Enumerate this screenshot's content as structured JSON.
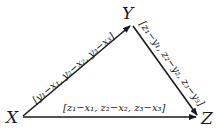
{
  "diagram": {
    "vertices": {
      "X": {
        "label": "X"
      },
      "Y": {
        "label": "Y"
      },
      "Z": {
        "label": "Z"
      }
    },
    "edges": {
      "XY": {
        "from": "X",
        "to": "Y",
        "label": "[y₁−x₁, y₂−x₂, y₃−x₃]"
      },
      "YZ": {
        "from": "Y",
        "to": "Z",
        "label": "[z₁−y₁, z₂−y₂, z₃−y₃]"
      },
      "XZ": {
        "from": "X",
        "to": "Z",
        "label": "[z₁−x₁, z₂−x₂, z₃−x₃]"
      }
    },
    "colors": {
      "line": "#1a1a1a",
      "background": "#ffffff"
    }
  }
}
